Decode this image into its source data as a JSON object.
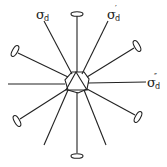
{
  "diagram": {
    "type": "symmetry-elements",
    "center": [
      77,
      83
    ],
    "labels": [
      {
        "id": "sigma_d",
        "symbol": "σ",
        "subscript": "d",
        "prime": ""
      },
      {
        "id": "sigma_d_prime",
        "symbol": "σ",
        "subscript": "d",
        "prime": "′"
      },
      {
        "id": "sigma_d_double_prime",
        "symbol": "σ",
        "subscript": "d",
        "prime": "″"
      }
    ],
    "twofold_axes_count": 6,
    "mirror_planes_count": 3,
    "colors": {
      "stroke": "#222222",
      "background": "#ffffff"
    }
  }
}
